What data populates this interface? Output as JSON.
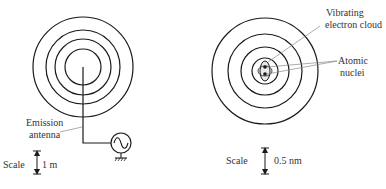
{
  "left_panel": {
    "label_line1": "Emission",
    "label_line2": "antenna",
    "scale_label": "Scale",
    "scale_value": "1 m",
    "wave_ring_count": 4
  },
  "right_panel": {
    "cloud_label_line1": "Vibrating",
    "cloud_label_line2": "electron cloud",
    "nuclei_label_line1": "Atomic",
    "nuclei_label_line2": "nuclei",
    "scale_label": "Scale",
    "scale_value": "0.5 nm",
    "wave_ring_count": 4
  },
  "colors": {
    "stroke": "#1a1a1a",
    "leader": "#888888",
    "text": "#333333"
  }
}
